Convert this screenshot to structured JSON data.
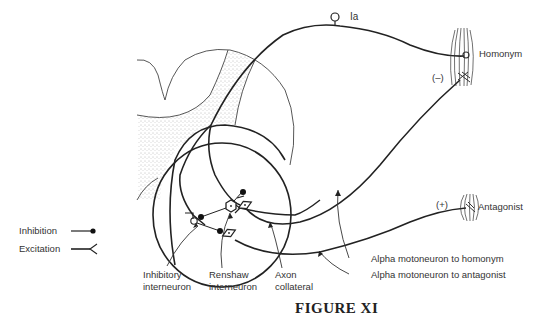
{
  "figure": {
    "title": "FIGURE XI",
    "labels": {
      "ia": "Ia",
      "homonym": "Homonym",
      "minus": "(–)",
      "plus": "(+)",
      "antagonist": "Antagonist",
      "alpha_homonym": "Alpha motoneuron to homonym",
      "alpha_antagonist": "Alpha motoneuron to antagonist",
      "inhibitory_1": "Inhibitory",
      "inhibitory_2": "interneuron",
      "renshaw_1": "Renshaw",
      "renshaw_2": "interneuron",
      "axon_1": "Axon",
      "axon_2": "collateral"
    },
    "legend": {
      "inhibition": "Inhibition",
      "excitation": "Excitation"
    }
  }
}
